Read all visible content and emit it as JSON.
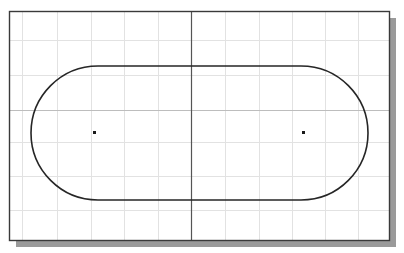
{
  "diagram": {
    "type": "cad-sketch",
    "canvas": {
      "width": 404,
      "height": 253
    },
    "frame": {
      "x": 9,
      "y": 11,
      "width": 380,
      "height": 229,
      "stroke": "#3a3a3a",
      "shadow_color": "#9a9a9a",
      "shadow_offset": 7
    },
    "grid": {
      "color": "#e2e2e2",
      "vertical_lines_x": [
        22,
        57,
        91,
        124,
        158,
        225,
        259,
        292,
        325,
        358
      ],
      "horizontal_lines_y": [
        40,
        75,
        142,
        176,
        210
      ]
    },
    "axes": {
      "color": "#555555",
      "vertical_axis_x": 191,
      "horizontal_axis_y": 110,
      "horizontal_axis_color": "#bdbdbd"
    },
    "slot": {
      "left_center": {
        "x": 98,
        "y": 133
      },
      "right_center": {
        "x": 301,
        "y": 133
      },
      "radius": 67,
      "stroke": "#262626",
      "stroke_width": 1.6
    },
    "center_points": [
      {
        "label": "left-center-point",
        "x": 94.5,
        "y": 132.5,
        "size": 3
      },
      {
        "label": "right-center-point",
        "x": 303.5,
        "y": 132.5,
        "size": 3
      }
    ]
  }
}
